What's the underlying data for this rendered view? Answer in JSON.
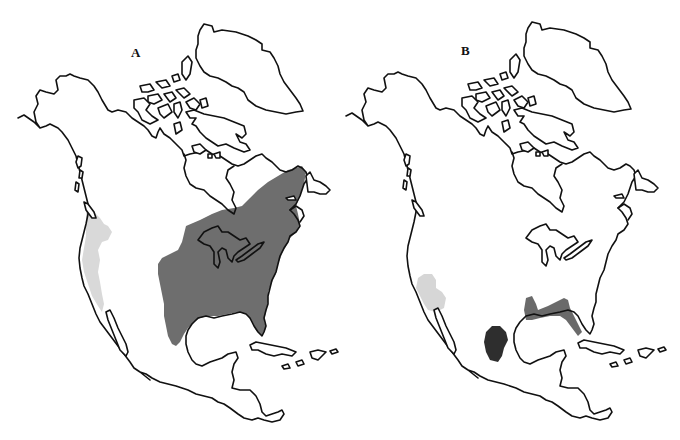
{
  "figure": {
    "panels": [
      {
        "id": "A",
        "label": "A",
        "ranges": [
          {
            "name": "eastern-range",
            "shade": "dark-gray",
            "color": "#6e6e6e",
            "region": "Eastern North America: Great Plains to Atlantic coast, north into southeastern Canada/Quebec, south to Gulf Coast and Florida"
          },
          {
            "name": "western-range",
            "shade": "light-gray",
            "color": "#d9d9d9",
            "region": "Pacific coast: Washington, Oregon, California"
          }
        ]
      },
      {
        "id": "B",
        "label": "B",
        "ranges": [
          {
            "name": "southwest-range",
            "shade": "light-gray",
            "color": "#d6d6d6",
            "region": "Southwestern US: Arizona / southern California interior"
          },
          {
            "name": "gulf-coast-range",
            "shade": "medium-gray",
            "color": "#6a6a6a",
            "region": "Southeastern US Gulf Coast and Florida"
          },
          {
            "name": "texas-mexico-range",
            "shade": "black",
            "color": "#2e2e2e",
            "region": "Southern Texas / northeastern Mexico Gulf coast"
          }
        ]
      }
    ],
    "colors": {
      "outline": "#111111",
      "background": "#ffffff"
    }
  }
}
